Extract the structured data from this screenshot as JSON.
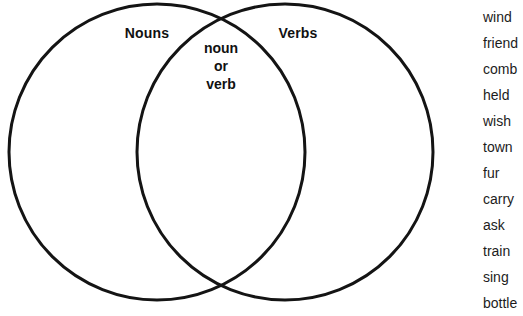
{
  "page": {
    "background_color": "#ffffff",
    "width": 523,
    "height": 316
  },
  "venn": {
    "stroke_color": "#141414",
    "stroke_width": 3,
    "fill": "none",
    "left_circle": {
      "label": "Nouns",
      "cx": 157,
      "cy": 152,
      "r": 148
    },
    "right_circle": {
      "label": "Verbs",
      "cx": 285,
      "cy": 152,
      "r": 148
    },
    "intersection": {
      "line1": "noun",
      "line2": "or",
      "line3": "verb"
    }
  },
  "word_bank": {
    "text_color": "#1c1c1c",
    "words": [
      "wind",
      "friend",
      "comb",
      "held",
      "wish",
      "town",
      "fur",
      "carry",
      "ask",
      "train",
      "sing",
      "bottle"
    ]
  },
  "footer": {
    "clipped_text": ""
  }
}
